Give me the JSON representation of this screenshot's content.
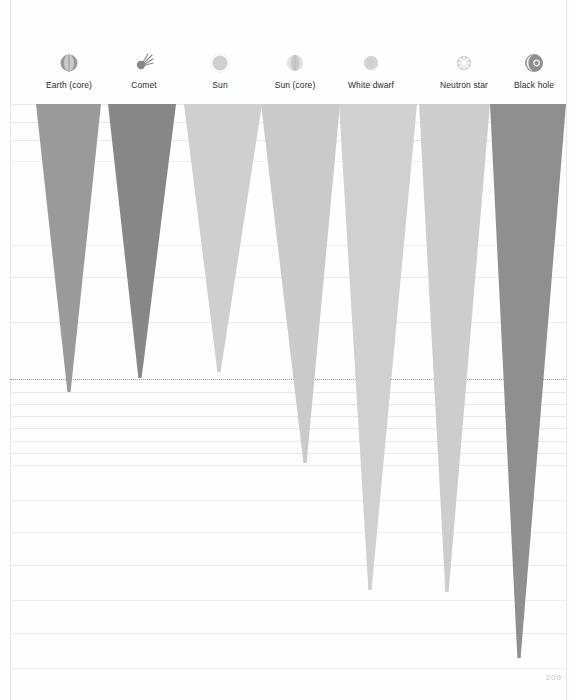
{
  "page": {
    "number": "209",
    "background": "#fefefe",
    "width": 576,
    "height": 700
  },
  "legend": {
    "items": [
      {
        "label": "Earth (core)",
        "icon": "earth-core-icon",
        "color": "#9a9a9a",
        "cx": 69
      },
      {
        "label": "Comet",
        "icon": "comet-icon",
        "color": "#878787",
        "cx": 144
      },
      {
        "label": "Sun",
        "icon": "sun-icon",
        "color": "#cfcfcf",
        "cx": 220
      },
      {
        "label": "Sun (core)",
        "icon": "sun-core-icon",
        "color": "#cacaca",
        "cx": 295
      },
      {
        "label": "White dwarf",
        "icon": "white-dwarf-icon",
        "color": "#d0d0d0",
        "cx": 371
      },
      {
        "label": "Neutron star",
        "icon": "neutron-star-icon",
        "color": "#cdcdcd",
        "cx": 464
      },
      {
        "label": "Black hole",
        "icon": "black-hole-icon",
        "color": "#8f8f8f",
        "cx": 534
      }
    ]
  },
  "chart_data": {
    "type": "area",
    "title": "",
    "subtitle": "",
    "xlabel": "",
    "ylabel": "",
    "grid": true,
    "legend_position": "top",
    "note": "Gravity-well funnels: each cone's depth represents the escape velocity / gravitational potential well of the object.",
    "categories": [
      "Earth (core)",
      "Comet",
      "Sun",
      "Sun (core)",
      "White dwarf",
      "Neutron star",
      "Black hole"
    ],
    "colors": [
      "#9a9a9a",
      "#878787",
      "#cfcfcf",
      "#cacaca",
      "#d0d0d0",
      "#cdcdcd",
      "#8f8f8f"
    ],
    "cones": [
      {
        "name": "Earth (core)",
        "color": "#9a9a9a",
        "top_left": 36,
        "top_right": 101,
        "tip_x": 69,
        "top_y": 104,
        "tip_y": 392
      },
      {
        "name": "Comet",
        "color": "#878787",
        "top_left": 108,
        "top_right": 176,
        "tip_x": 140,
        "top_y": 104,
        "tip_y": 378
      },
      {
        "name": "Sun",
        "color": "#cfcfcf",
        "top_left": 184,
        "top_right": 262,
        "tip_x": 219,
        "top_y": 104,
        "tip_y": 372
      },
      {
        "name": "Sun (core)",
        "color": "#cacaca",
        "top_left": 261,
        "top_right": 340,
        "tip_x": 305,
        "top_y": 104,
        "tip_y": 463
      },
      {
        "name": "White dwarf",
        "color": "#d0d0d0",
        "top_left": 339,
        "top_right": 417,
        "tip_x": 370,
        "top_y": 104,
        "tip_y": 590
      },
      {
        "name": "Neutron star",
        "color": "#cdcdcd",
        "top_left": 419,
        "top_right": 490,
        "tip_x": 447,
        "top_y": 104,
        "tip_y": 592
      },
      {
        "name": "Black hole",
        "color": "#8f8f8f",
        "top_left": 490,
        "top_right": 566,
        "tip_x": 519,
        "top_y": 104,
        "tip_y": 658
      }
    ],
    "gridlines": [
      104,
      122,
      140,
      277,
      322,
      392,
      404,
      416,
      428,
      441,
      453,
      465,
      565,
      633
    ],
    "dotted_gridline": 379,
    "faint_gridlines": [
      161,
      245,
      500,
      532,
      600,
      668
    ]
  }
}
